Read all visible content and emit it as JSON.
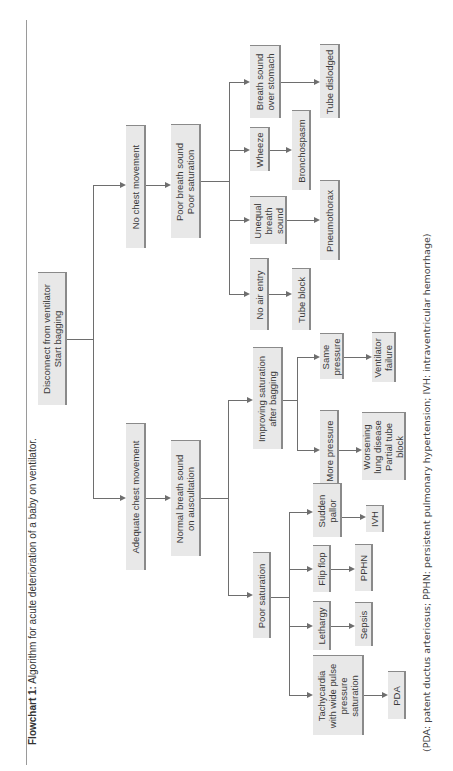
{
  "caption": {
    "label": "Flowchart 1:",
    "text": " Algorithm for acute deterioration of a baby on ventilator."
  },
  "footnote": "(PDA: patent ductus arteriosus; PPHN: persistent pulmonary hypertension; IVH: intraventricular hemorrhage)",
  "flowchart": {
    "root": "Disconnect from ventilator\nStart bagging",
    "no_chest": {
      "label": "No chest movement",
      "next": "Poor breath sound\nPoor saturation",
      "branches": [
        {
          "finding": "No air entry",
          "cause": "Tube block"
        },
        {
          "finding": "Unequal\nbreath\nsound",
          "cause": "Pneumothorax"
        },
        {
          "finding": "Wheeze",
          "cause": "Bronchospasm"
        },
        {
          "finding": "Breath sound\nover stomach",
          "cause": "Tube dislodged"
        }
      ]
    },
    "adequate_chest": {
      "label": "Adequate chest movement",
      "next": "Normal breath sound\non auscultation",
      "improving": {
        "label": "Improving saturation\nafter bagging",
        "branches": [
          {
            "finding": "More pressure",
            "cause": "Worsening\nlung disease\nPartial tube\nblock"
          },
          {
            "finding": "Same\npressure",
            "cause": "Ventilator\nfailure"
          }
        ]
      },
      "poor_sat": {
        "label": "Poor saturation",
        "branches": [
          {
            "finding": "Tachycardia\nwith wide pulse\npressure\nsaturation",
            "cause": "PDA"
          },
          {
            "finding": "Lethargy",
            "cause": "Sepsis"
          },
          {
            "finding": "Flip flop",
            "cause": "PPHN"
          },
          {
            "finding": "Sudden\npallor",
            "cause": "IVH"
          }
        ]
      }
    }
  },
  "colors": {
    "box_fill": "#e8e8e8",
    "box_edge": "#8a8a8a",
    "line": "#6e6e6e",
    "text": "#3a3a3a"
  }
}
